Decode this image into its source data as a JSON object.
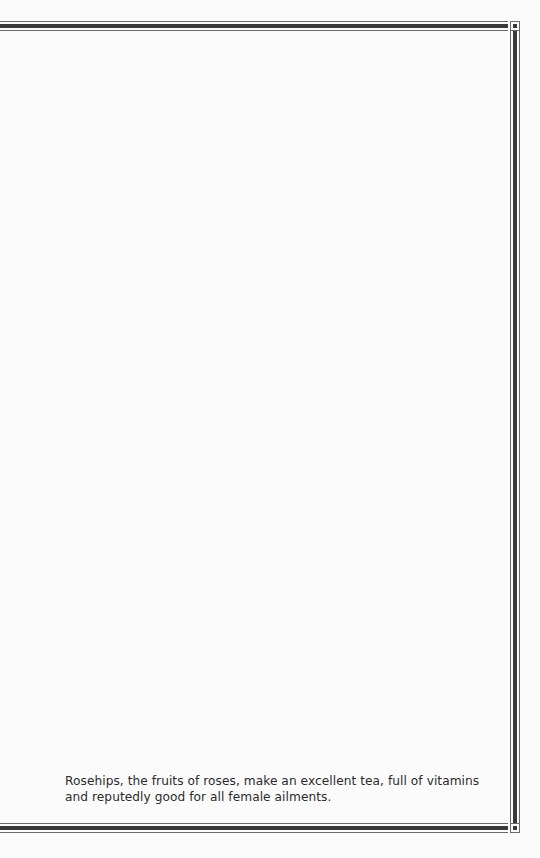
{
  "page": {
    "caption": "Rosehips, the fruits of roses, make an excellent tea, full of vitamins and reputedly good for all female ailments."
  },
  "colors": {
    "background": "#fbfbfb",
    "rule_thick": "#3a3a3a",
    "rule_thin": "#6a6a6a",
    "text": "#2b2b2b"
  }
}
